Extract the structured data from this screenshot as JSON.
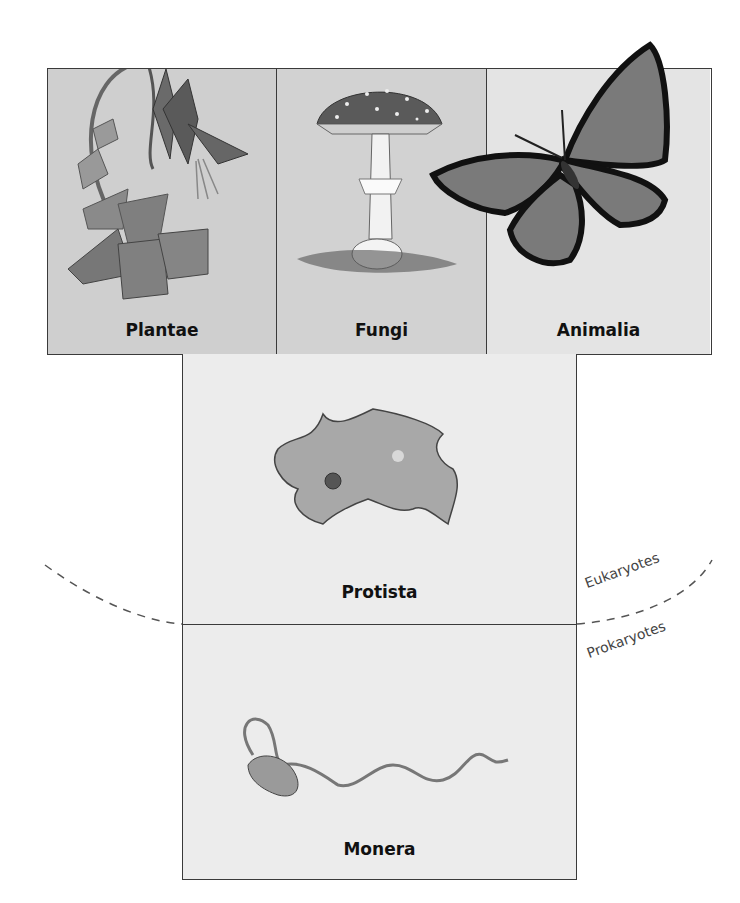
{
  "diagram": {
    "kingdoms_top": [
      {
        "id": "plantae",
        "label": "Plantae",
        "illustration": "columbine-flower-plant"
      },
      {
        "id": "fungi",
        "label": "Fungi",
        "illustration": "amanita-mushroom"
      },
      {
        "id": "animalia",
        "label": "Animalia",
        "illustration": "monarch-butterfly"
      }
    ],
    "kingdoms_lower": [
      {
        "id": "protista",
        "label": "Protista",
        "illustration": "amoeba"
      },
      {
        "id": "monera",
        "label": "Monera",
        "illustration": "spirochete-bacterium"
      }
    ],
    "divider": {
      "style": "dashed-curve",
      "above_label": "Eukaryotes",
      "below_label": "Prokaryotes"
    },
    "colors": {
      "border": "#3a3a3a",
      "plantae_bg": "#cfcfcf",
      "fungi_bg": "#d2d2d2",
      "animalia_bg": "#e4e4e4",
      "lower_bg": "#ececec",
      "dash": "#555555"
    }
  }
}
